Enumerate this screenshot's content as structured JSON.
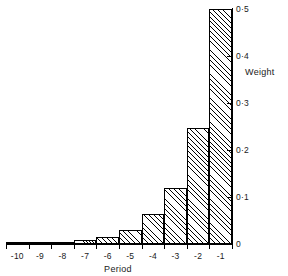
{
  "chart_data": {
    "type": "bar",
    "title": "",
    "subtitle": "",
    "xlabel": "Period",
    "ylabel": "Weight",
    "categories": [
      "-10",
      "-9",
      "-8",
      "-7",
      "-6",
      "-5",
      "-4",
      "-3",
      "-2",
      "-1"
    ],
    "values": [
      0.0,
      0.002,
      0.005,
      0.008,
      0.015,
      0.03,
      0.064,
      0.12,
      0.247,
      0.5
    ],
    "series": [
      {
        "name": "Weight",
        "values": [
          0.0,
          0.002,
          0.005,
          0.008,
          0.015,
          0.03,
          0.064,
          0.12,
          0.247,
          0.5
        ]
      }
    ],
    "ylim": [
      0,
      0.5
    ],
    "xlim": [
      -10.5,
      -0.5
    ],
    "y_ticks": [
      0,
      0.1,
      0.2,
      0.3,
      0.4,
      0.5
    ],
    "y_tick_labels": [
      "0",
      "0·1",
      "0·2",
      "0·3",
      "0·4",
      "0·5"
    ],
    "x_tick_labels": [
      "-10",
      "-9",
      "-8",
      "-7",
      "-6",
      "-5",
      "-4",
      "-3",
      "-2",
      "-1"
    ],
    "grid": false,
    "legend": false,
    "legend_position": "none",
    "y_axis_side": "right",
    "bar_fill": "diagonal-hatch",
    "line_color": "#000000",
    "background_color": "#ffffff",
    "annotations": []
  },
  "axes": {
    "x_title": "Period",
    "y_title": "Weight"
  }
}
